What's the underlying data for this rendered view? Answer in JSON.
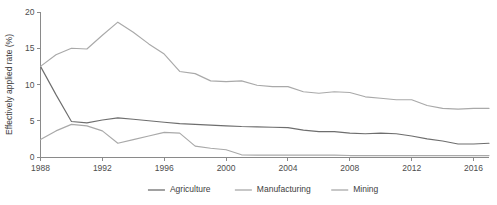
{
  "chart_data": {
    "type": "line",
    "title": "",
    "subtitle": "",
    "xlabel": "",
    "ylabel": "Effectively applied rate (%)",
    "xlim": [
      1988,
      2017
    ],
    "ylim": [
      0,
      20
    ],
    "yticks": [
      0,
      5,
      10,
      15,
      20
    ],
    "ytick_labels": [
      "0",
      "5",
      "10",
      "15",
      "20"
    ],
    "xticks": [
      1988,
      1992,
      1996,
      2000,
      2004,
      2008,
      2012,
      2016
    ],
    "xtick_labels": [
      "1988",
      "1992",
      "1996",
      "2000",
      "2004",
      "2008",
      "2012",
      "2016"
    ],
    "grid": false,
    "legend_position": "bottom-center",
    "x": [
      1988,
      1989,
      1990,
      1991,
      1992,
      1993,
      1994,
      1995,
      1996,
      1997,
      1998,
      1999,
      2000,
      2001,
      2002,
      2003,
      2004,
      2005,
      2006,
      2007,
      2008,
      2009,
      2010,
      2011,
      2012,
      2013,
      2014,
      2015,
      2016,
      2017
    ],
    "series": [
      {
        "name": "Agriculture",
        "color": "#6e6e6e",
        "values": [
          12.5,
          8.6,
          4.9,
          4.7,
          5.1,
          5.4,
          5.2,
          5.0,
          4.8,
          4.6,
          4.5,
          4.4,
          4.3,
          4.2,
          4.15,
          4.1,
          4.05,
          3.7,
          3.5,
          3.5,
          3.3,
          3.2,
          3.3,
          3.2,
          2.9,
          2.5,
          2.2,
          1.8,
          1.8,
          1.9
        ]
      },
      {
        "name": "Manufacturing",
        "color": "#a9a9a9",
        "values": [
          2.4,
          3.6,
          4.5,
          4.3,
          3.6,
          1.9,
          2.4,
          2.9,
          3.4,
          3.3,
          1.5,
          1.2,
          1.0,
          0.3,
          0.25,
          0.25,
          0.25,
          0.25,
          0.25,
          0.25,
          0.2,
          0.2,
          0.2,
          0.2,
          0.2,
          0.2,
          0.2,
          0.2,
          0.2,
          0.2
        ]
      },
      {
        "name": "Mining",
        "color": "#a9a9a9",
        "values": [
          12.5,
          14.1,
          15.0,
          14.9,
          16.8,
          18.6,
          17.2,
          15.6,
          14.2,
          11.8,
          11.5,
          10.5,
          10.4,
          10.5,
          9.9,
          9.7,
          9.7,
          9.0,
          8.8,
          9.0,
          8.9,
          8.3,
          8.1,
          7.9,
          7.9,
          7.1,
          6.7,
          6.6,
          6.7,
          6.7
        ]
      }
    ]
  },
  "legend": {
    "items": [
      {
        "label": "Agriculture"
      },
      {
        "label": "Manufacturing"
      },
      {
        "label": "Mining"
      }
    ]
  },
  "colors": {
    "axis": "#8a8a8a",
    "text": "#3d3d3d",
    "background": "#ffffff"
  }
}
